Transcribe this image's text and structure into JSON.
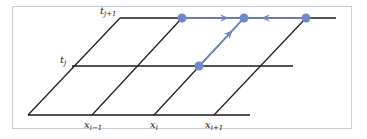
{
  "diagram": {
    "colors": {
      "grid": "#1a1a1a",
      "accent": "#6f88c9",
      "frame": "#c8ccd6",
      "background": "#ffffff"
    },
    "time_labels": [
      {
        "base": "t",
        "sub": "j+1"
      },
      {
        "base": "t",
        "sub": "j"
      }
    ],
    "space_labels": [
      {
        "base": "x",
        "sub": "i−1"
      },
      {
        "base": "x",
        "sub": "i"
      },
      {
        "base": "x",
        "sub": "i+1"
      }
    ],
    "nodes": [
      {
        "id": "top-left",
        "x": 182,
        "y": 18
      },
      {
        "id": "top-center",
        "x": 244,
        "y": 18
      },
      {
        "id": "top-right",
        "x": 306,
        "y": 18
      },
      {
        "id": "mid-center",
        "x": 199,
        "y": 66
      }
    ],
    "arrows": [
      {
        "from": "top-left",
        "to": "top-center"
      },
      {
        "from": "top-right",
        "to": "top-center"
      },
      {
        "from": "mid-center",
        "to": "top-center"
      }
    ]
  }
}
